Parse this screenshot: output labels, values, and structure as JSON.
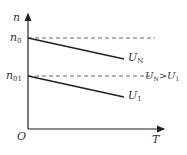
{
  "diagram": {
    "y_axis_label": "n",
    "x_axis_label": "T",
    "origin_label": "O",
    "tick_labels": {
      "n0": {
        "base": "n",
        "sub": "0"
      },
      "n01": {
        "base": "n",
        "sub": "01"
      }
    },
    "curves": [
      {
        "name": "U_N",
        "base": "U",
        "sub": "N"
      },
      {
        "name": "U_1",
        "base": "U",
        "sub": "1"
      }
    ],
    "annotation": {
      "lhs_base": "U",
      "lhs_sub": "N",
      "op": ">",
      "rhs_base": "U",
      "rhs_sub": "1"
    },
    "colors": {
      "line": "#222222",
      "dash": "#555555",
      "text": "#333333"
    }
  }
}
